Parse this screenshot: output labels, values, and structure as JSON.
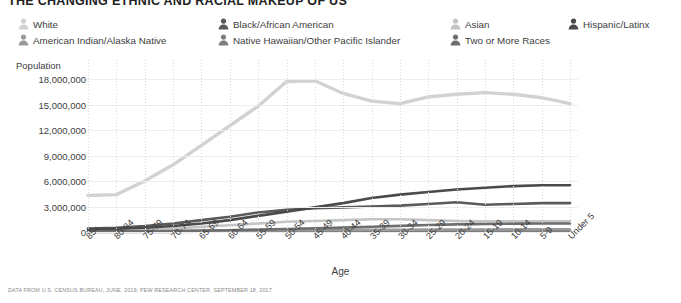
{
  "title": "THE CHANGING ETHNIC AND RACIAL MAKEUP OF US",
  "footer": "DATA FROM U.S. CENSUS BUREAU, JUNE, 2019; PEW RESEARCH CENTER, SEPTEMBER 18, 2017",
  "legend": {
    "icon_name": "person-icon",
    "items": [
      {
        "label": "White",
        "color": "#d2d2d2",
        "x": 0,
        "y": 0
      },
      {
        "label": "American Indian/Alaska Native",
        "color": "#9a9a9a",
        "x": 0,
        "y": 16
      },
      {
        "label": "Black/African American",
        "color": "#5a5a5a",
        "x": 200,
        "y": 0
      },
      {
        "label": "Native Hawaiian/Other Pacific Islander",
        "color": "#7d7d7d",
        "x": 200,
        "y": 16
      },
      {
        "label": "Asian",
        "color": "#c4c4c4",
        "x": 432,
        "y": 0
      },
      {
        "label": "Two or More Races",
        "color": "#6e6e6e",
        "x": 432,
        "y": 16
      },
      {
        "label": "Hispanic/Latinx",
        "color": "#4a4a4a",
        "x": 550,
        "y": 0
      }
    ]
  },
  "chart_data": {
    "type": "line",
    "title": "THE CHANGING ETHNIC AND RACIAL MAKEUP OF US",
    "xlabel": "Age",
    "ylabel": "Population",
    "ylim": [
      0,
      18000000
    ],
    "yticks": [
      0,
      3000000,
      6000000,
      9000000,
      12000000,
      15000000,
      18000000
    ],
    "ytick_labels": [
      "0",
      "3,000,000",
      "6,000,000",
      "9,000,000",
      "12,000,000",
      "15,000,000",
      "18,000,000"
    ],
    "grid": true,
    "legend_position": "top",
    "categories": [
      "85+",
      "80-84",
      "75-79",
      "70-74",
      "65-69",
      "60-64",
      "55-59",
      "50-54",
      "45-49",
      "40-44",
      "35-39",
      "30-34",
      "25-29",
      "20-24",
      "15-19",
      "10-14",
      "5-9",
      "Under 5"
    ],
    "series": [
      {
        "name": "White",
        "color": "#d2d2d2",
        "values": [
          4300000,
          4400000,
          6000000,
          7900000,
          10200000,
          12500000,
          14800000,
          17700000,
          17800000,
          16300000,
          15400000,
          15100000,
          15900000,
          16200000,
          16400000,
          16200000,
          15800000,
          15100000
        ]
      },
      {
        "name": "Hispanic/Latinx",
        "color": "#4a4a4a",
        "values": [
          300000,
          400000,
          500000,
          700000,
          1000000,
          1400000,
          1900000,
          2400000,
          2900000,
          3400000,
          4000000,
          4400000,
          4700000,
          5000000,
          5200000,
          5400000,
          5500000,
          5500000
        ]
      },
      {
        "name": "Black/African American",
        "color": "#5a5a5a",
        "values": [
          400000,
          500000,
          700000,
          1000000,
          1400000,
          1800000,
          2300000,
          2600000,
          2800000,
          2900000,
          3000000,
          3100000,
          3300000,
          3500000,
          3200000,
          3300000,
          3400000,
          3400000
        ]
      },
      {
        "name": "Asian",
        "color": "#c4c4c4",
        "values": [
          150000,
          200000,
          300000,
          400000,
          600000,
          800000,
          1000000,
          1200000,
          1300000,
          1400000,
          1500000,
          1500000,
          1400000,
          1300000,
          1250000,
          1250000,
          1250000,
          1250000
        ]
      },
      {
        "name": "Two or More Races",
        "color": "#6e6e6e",
        "values": [
          60000,
          70000,
          90000,
          120000,
          160000,
          210000,
          280000,
          350000,
          430000,
          520000,
          620000,
          720000,
          820000,
          900000,
          950000,
          980000,
          1000000,
          1000000
        ]
      },
      {
        "name": "American Indian/Alaska Native",
        "color": "#9a9a9a",
        "values": [
          40000,
          50000,
          70000,
          90000,
          120000,
          150000,
          190000,
          220000,
          240000,
          250000,
          260000,
          270000,
          280000,
          290000,
          300000,
          310000,
          320000,
          320000
        ]
      },
      {
        "name": "Native Hawaiian/Other Pacific Islander",
        "color": "#7d7d7d",
        "values": [
          10000,
          12000,
          16000,
          20000,
          26000,
          33000,
          42000,
          50000,
          58000,
          65000,
          72000,
          78000,
          84000,
          88000,
          92000,
          95000,
          98000,
          100000
        ]
      }
    ]
  }
}
